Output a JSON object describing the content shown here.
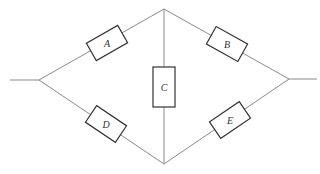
{
  "diagram": {
    "type": "bridge-network",
    "components": [
      {
        "id": "A",
        "label": "A",
        "from": "left",
        "to": "top"
      },
      {
        "id": "B",
        "label": "B",
        "from": "top",
        "to": "right"
      },
      {
        "id": "C",
        "label": "C",
        "from": "top",
        "to": "bottom"
      },
      {
        "id": "D",
        "label": "D",
        "from": "left",
        "to": "bottom"
      },
      {
        "id": "E",
        "label": "E",
        "from": "bottom",
        "to": "right"
      }
    ],
    "nodes": [
      "left",
      "top",
      "bottom",
      "right"
    ],
    "colors": {
      "wire": "#8a8a8a",
      "box": "#333333",
      "background": "#ffffff"
    }
  }
}
